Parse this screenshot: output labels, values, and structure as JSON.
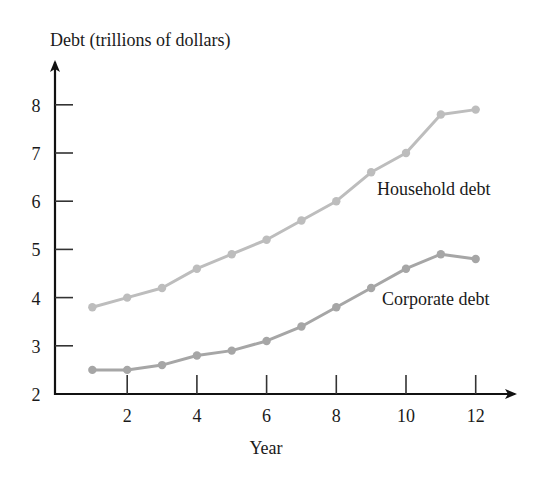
{
  "chart_data": {
    "type": "line",
    "title": "",
    "xlabel": "Year",
    "ylabel": "Debt (trillions of dollars)",
    "x": [
      1,
      2,
      3,
      4,
      5,
      6,
      7,
      8,
      9,
      10,
      11,
      12
    ],
    "xticks": [
      2,
      4,
      6,
      8,
      10,
      12
    ],
    "yticks": [
      2,
      3,
      4,
      5,
      6,
      7,
      8
    ],
    "xlim": [
      0,
      13
    ],
    "ylim": [
      2,
      8.8
    ],
    "grid": false,
    "legend_position": "inline labels at right",
    "series": [
      {
        "name": "Household debt",
        "color": "#bdbdbd",
        "values": [
          3.8,
          4.0,
          4.2,
          4.6,
          4.9,
          5.2,
          5.6,
          6.0,
          6.6,
          7.0,
          7.8,
          7.9
        ]
      },
      {
        "name": "Corporate debt",
        "color": "#a6a6a6",
        "values": [
          2.5,
          2.5,
          2.6,
          2.8,
          2.9,
          3.1,
          3.4,
          3.8,
          4.2,
          4.6,
          4.9,
          4.8
        ]
      }
    ]
  },
  "labels": {
    "ylabel": "Debt (trillions of dollars)",
    "xlabel": "Year",
    "household": "Household debt",
    "corporate": "Corporate debt"
  }
}
